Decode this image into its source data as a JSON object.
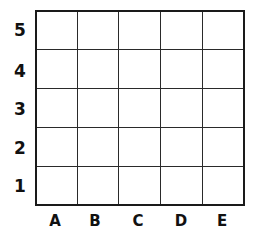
{
  "grid": {
    "columns": 5,
    "rows": 5,
    "column_labels": [
      "A",
      "B",
      "C",
      "D",
      "E"
    ],
    "row_labels_top_to_bottom": [
      "5",
      "4",
      "3",
      "2",
      "1"
    ]
  }
}
